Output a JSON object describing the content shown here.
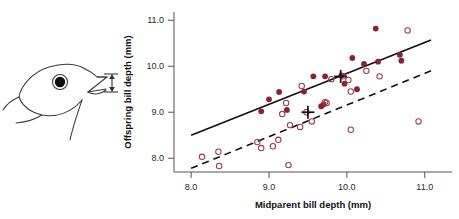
{
  "figure": {
    "illustration_name": "finch-head-bill-depth-diagram",
    "illustration_caption": "",
    "bill_depth_arrow_name": "bill-depth-arrow"
  },
  "chart_data": {
    "type": "scatter",
    "title": "",
    "xlabel": "Midparent bill depth (mm)",
    "ylabel": "Offspring bill depth (mm)",
    "xlim": [
      7.78,
      11.35
    ],
    "ylim": [
      7.7,
      11.18
    ],
    "xticks": [
      8.0,
      9.0,
      10.0,
      11.0
    ],
    "xtick_labels": [
      "8.0",
      "9.0",
      "10.0",
      "11.0"
    ],
    "yticks": [
      8.0,
      9.0,
      10.0,
      11.0
    ],
    "ytick_labels": [
      "8.0",
      "9.0",
      "10.0",
      "11.0"
    ],
    "grid": false,
    "legend": "none",
    "colors": {
      "filled_point": "#8b2233",
      "open_point": "#9e3a48",
      "solid_line": "#101010",
      "dashed_line": "#101010",
      "axis": "#555555",
      "text": "#111111"
    },
    "series": [
      {
        "name": "Filled points (dark red)",
        "marker": "filled-circle",
        "color": "#8b2233",
        "points": [
          [
            8.9,
            9.02
          ],
          [
            9.0,
            9.28
          ],
          [
            9.13,
            9.44
          ],
          [
            9.23,
            9.05
          ],
          [
            9.45,
            9.45
          ],
          [
            9.57,
            9.78
          ],
          [
            9.72,
            9.78
          ],
          [
            9.67,
            9.13
          ],
          [
            9.7,
            9.17
          ],
          [
            9.93,
            9.8
          ],
          [
            9.97,
            9.62
          ],
          [
            10.07,
            10.18
          ],
          [
            10.13,
            9.5
          ],
          [
            10.22,
            10.05
          ],
          [
            10.37,
            10.82
          ],
          [
            10.4,
            10.1
          ],
          [
            10.68,
            10.25
          ],
          [
            10.7,
            10.12
          ]
        ]
      },
      {
        "name": "Open points",
        "marker": "open-circle",
        "color": "#9e3a48",
        "points": [
          [
            8.14,
            8.03
          ],
          [
            8.35,
            8.14
          ],
          [
            8.36,
            7.83
          ],
          [
            8.85,
            8.35
          ],
          [
            8.9,
            8.22
          ],
          [
            9.05,
            8.26
          ],
          [
            9.12,
            8.4
          ],
          [
            9.17,
            8.96
          ],
          [
            9.22,
            9.2
          ],
          [
            9.25,
            7.85
          ],
          [
            9.27,
            8.72
          ],
          [
            9.4,
            8.68
          ],
          [
            9.42,
            9.57
          ],
          [
            9.48,
            9.0
          ],
          [
            9.55,
            8.8
          ],
          [
            9.72,
            9.22
          ],
          [
            9.74,
            9.2
          ],
          [
            9.8,
            9.72
          ],
          [
            9.95,
            9.78
          ],
          [
            10.02,
            9.7
          ],
          [
            10.05,
            9.45
          ],
          [
            10.05,
            8.62
          ],
          [
            10.25,
            9.9
          ],
          [
            10.42,
            9.78
          ],
          [
            10.78,
            10.78
          ],
          [
            10.92,
            8.8
          ]
        ]
      },
      {
        "name": "Group means (cross markers)",
        "marker": "cross",
        "color": "#101010",
        "points": [
          [
            9.92,
            9.78
          ],
          [
            9.5,
            9.0
          ]
        ]
      }
    ],
    "lines": [
      {
        "name": "solid-regression-line",
        "style": "solid",
        "color": "#101010",
        "x0": 8.0,
        "y0": 8.5,
        "x1": 11.08,
        "y1": 10.57
      },
      {
        "name": "dashed-regression-line",
        "style": "dashed",
        "color": "#101010",
        "x0": 8.0,
        "y0": 7.78,
        "x1": 11.08,
        "y1": 9.9
      }
    ]
  }
}
